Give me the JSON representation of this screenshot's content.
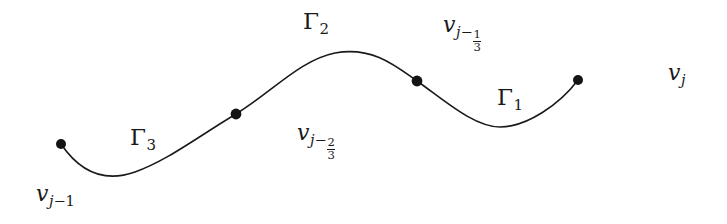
{
  "figure": {
    "background_color": "#ffffff",
    "curve_color": "#1a1a1a",
    "label_color": "#1a1a1a",
    "vertex_color": "#141414",
    "canvas": {
      "width": 727,
      "height": 224
    }
  },
  "curve": {
    "type": "sinusoidal-spline",
    "stroke_width": 1.6,
    "path": "M 61,144 C 80,172 104,183 135,172 C 168,160 196,138 236,114 C 272,92 300,60 335,53 C 372,46 396,66 417,81 C 444,100 474,127 500,127 C 527,127 560,104 578,80"
  },
  "vertices": [
    {
      "id": "v-j-minus-1",
      "x": 61,
      "y": 144,
      "r": 5.0,
      "label_key": "v_j_minus_1"
    },
    {
      "id": "v-j-minus-2-3",
      "x": 236,
      "y": 114,
      "r": 5.4,
      "label_key": "v_j_minus_2_3"
    },
    {
      "id": "v-j-minus-1-3",
      "x": 417,
      "y": 81,
      "r": 5.4,
      "label_key": "v_j_minus_1_3"
    },
    {
      "id": "v-j",
      "x": 578,
      "y": 80,
      "r": 5.0,
      "label_key": "v_j"
    }
  ],
  "arc_labels": [
    {
      "id": "gamma-3",
      "symbol": "Γ",
      "subscript": "3",
      "x": 130,
      "y": 126
    },
    {
      "id": "gamma-2",
      "symbol": "Γ",
      "subscript": "2",
      "x": 303,
      "y": 10
    },
    {
      "id": "gamma-1",
      "symbol": "Γ",
      "subscript": "1",
      "x": 497,
      "y": 86
    }
  ],
  "vertex_labels": {
    "v_j_minus_1": {
      "id": "v-j-minus-1-label",
      "v": "v",
      "sub_base": "j",
      "sub_op": "−",
      "sub_value": "1",
      "fraction": null,
      "x": 36,
      "y": 183
    },
    "v_j_minus_2_3": {
      "id": "v-j-minus-2-3-label",
      "v": "v",
      "sub_base": "j",
      "sub_op": "−",
      "sub_value": "2/3",
      "fraction": {
        "numerator": "2",
        "denominator": "3"
      },
      "x": 297,
      "y": 122
    },
    "v_j_minus_1_3": {
      "id": "v-j-minus-1-3-label",
      "v": "v",
      "sub_base": "j",
      "sub_op": "−",
      "sub_value": "1/3",
      "fraction": {
        "numerator": "1",
        "denominator": "3"
      },
      "x": 443,
      "y": 14
    },
    "v_j": {
      "id": "v-j-label",
      "v": "v",
      "sub_base": "j",
      "sub_op": "",
      "sub_value": "",
      "fraction": null,
      "x": 668,
      "y": 62
    }
  }
}
